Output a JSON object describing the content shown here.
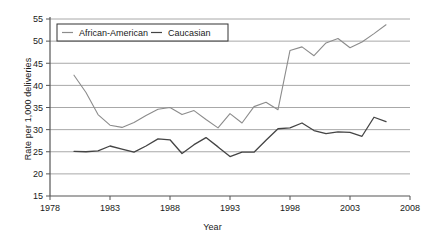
{
  "chart_data": {
    "type": "line",
    "title": "",
    "xlabel": "Year",
    "ylabel": "Rate per 1,000 deliveries",
    "xlim": [
      1978,
      2008
    ],
    "ylim": [
      15,
      55
    ],
    "xticks": [
      1978,
      1983,
      1988,
      1993,
      1998,
      2003,
      2008
    ],
    "yticks": [
      15,
      20,
      25,
      30,
      35,
      40,
      45,
      50,
      55
    ],
    "grid": "horizontal",
    "legend_position": "top-left-inside",
    "x": [
      1980,
      1981,
      1982,
      1983,
      1984,
      1985,
      1986,
      1987,
      1988,
      1989,
      1990,
      1991,
      1992,
      1993,
      1994,
      1995,
      1996,
      1997,
      1998,
      1999,
      2000,
      2001,
      2002,
      2003,
      2004,
      2005,
      2006
    ],
    "series": [
      {
        "name": "African-American",
        "color": "#8c8c8c",
        "values": [
          42.3,
          38.4,
          33.4,
          31.0,
          30.5,
          31.6,
          33.2,
          34.6,
          35.0,
          33.4,
          34.3,
          32.3,
          30.4,
          33.6,
          31.5,
          35.2,
          36.2,
          34.5,
          47.9,
          48.7,
          46.7,
          49.6,
          50.6,
          48.5,
          49.8,
          51.7,
          53.7
        ]
      },
      {
        "name": "Caucasian",
        "color": "#444444",
        "values": [
          25.1,
          25.0,
          25.2,
          26.3,
          25.6,
          24.9,
          26.3,
          27.9,
          27.7,
          24.6,
          26.6,
          28.2,
          26.1,
          23.9,
          24.9,
          24.9,
          27.6,
          30.2,
          30.4,
          31.5,
          29.8,
          29.1,
          29.5,
          29.4,
          28.5,
          32.8,
          31.8
        ]
      }
    ]
  },
  "legend": {
    "items": [
      {
        "label": "African-American"
      },
      {
        "label": "Caucasian"
      }
    ]
  }
}
